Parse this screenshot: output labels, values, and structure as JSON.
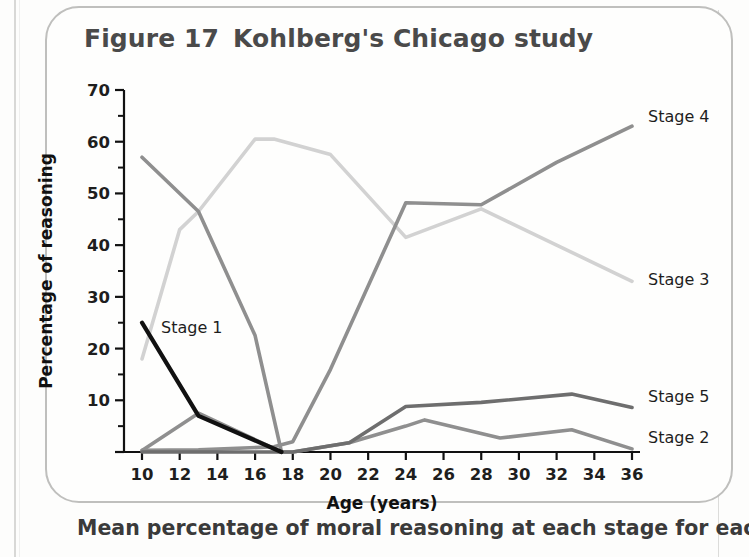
{
  "figure": {
    "number_label": "Figure 17",
    "title": "Kohlberg's Chicago study",
    "caption": "Mean percentage of moral reasoning at each stage for each"
  },
  "chart_data": {
    "type": "line",
    "xlabel": "Age (years)",
    "ylabel": "Percentage of reasoning",
    "xlim": [
      9,
      37
    ],
    "ylim": [
      0,
      70
    ],
    "xticks": [
      10,
      12,
      14,
      16,
      18,
      20,
      22,
      24,
      26,
      28,
      30,
      32,
      34,
      36
    ],
    "xtick_labels": [
      "10",
      "12",
      "14",
      "16",
      "18",
      "20",
      "22",
      "24",
      "26",
      "28",
      "30",
      "32",
      "34",
      "36"
    ],
    "yticks": [
      0,
      10,
      20,
      30,
      40,
      50,
      60,
      70
    ],
    "ytick_labels": [
      "",
      "10",
      "20",
      "30",
      "40",
      "50",
      "60",
      "70"
    ],
    "yminor_ticks": [
      5,
      15,
      25,
      35,
      45,
      55,
      65
    ],
    "grid": false,
    "legend_position": "right-of-lines",
    "series": [
      {
        "name": "Stage 1",
        "color": "#111111",
        "width": 4.2,
        "label_anchor": "inside",
        "label_x": 13.6,
        "label_y": 22.5,
        "points": [
          [
            10,
            25
          ],
          [
            13,
            7
          ],
          [
            17.4,
            0
          ]
        ]
      },
      {
        "name": "Stage 2",
        "color": "#8f8f8f",
        "width": 3.6,
        "label_anchor": "right",
        "points": [
          [
            10,
            0.3
          ],
          [
            13,
            7.5
          ],
          [
            17.4,
            0
          ],
          [
            18,
            0
          ],
          [
            21,
            1.8
          ],
          [
            24,
            5
          ],
          [
            25,
            6.2
          ],
          [
            29,
            2.7
          ],
          [
            32.8,
            4.3
          ],
          [
            36,
            0.6
          ]
        ]
      },
      {
        "name": "Stage 3",
        "color": "#d2d2d2",
        "width": 3.6,
        "label_anchor": "right",
        "points": [
          [
            10,
            18
          ],
          [
            12,
            43
          ],
          [
            13,
            46.5
          ],
          [
            16,
            60.5
          ],
          [
            17,
            60.5
          ],
          [
            20,
            57.5
          ],
          [
            24,
            41.5
          ],
          [
            28,
            47
          ],
          [
            32,
            40
          ],
          [
            36,
            33
          ]
        ]
      },
      {
        "name": "Stage 4",
        "color": "#8f8f8f",
        "width": 3.6,
        "label_anchor": "right",
        "points": [
          [
            10,
            0.3
          ],
          [
            13,
            0.4
          ],
          [
            17,
            1
          ],
          [
            18,
            2
          ],
          [
            20,
            16
          ],
          [
            24,
            48.2
          ],
          [
            28,
            47.8
          ],
          [
            32,
            56
          ],
          [
            36,
            63
          ]
        ]
      },
      {
        "name": "Stage 5",
        "color": "#6e6e6e",
        "width": 3.6,
        "label_anchor": "right",
        "points": [
          [
            10,
            0
          ],
          [
            18,
            0
          ],
          [
            20,
            1.2
          ],
          [
            21,
            1.8
          ],
          [
            24,
            8.8
          ],
          [
            28,
            9.6
          ],
          [
            32.8,
            11.2
          ],
          [
            36,
            8.6
          ]
        ]
      }
    ],
    "stage2_descending_head": {
      "name": "Stage 2 head",
      "color": "#8f8f8f",
      "width": 3.6,
      "points": [
        [
          10,
          57
        ],
        [
          13,
          46.5
        ],
        [
          16,
          22.5
        ],
        [
          17.4,
          0
        ]
      ]
    }
  },
  "axis": {
    "x_title": "Age (years)",
    "y_title": "Percentage of reasoning"
  },
  "series_labels": [
    {
      "name": "Stage 4",
      "x": 648,
      "y": 122
    },
    {
      "name": "Stage 3",
      "x": 648,
      "y": 285
    },
    {
      "name": "Stage 5",
      "x": 648,
      "y": 402
    },
    {
      "name": "Stage 2",
      "x": 648,
      "y": 443
    }
  ],
  "inner_labels": [
    {
      "name": "Stage 1",
      "x": 161,
      "y": 333
    }
  ]
}
